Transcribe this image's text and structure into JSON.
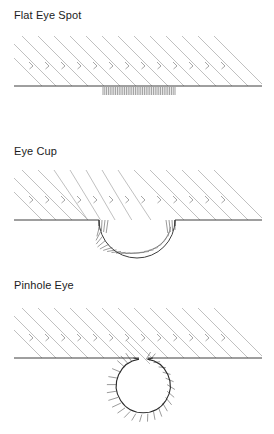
{
  "figure": {
    "background_color": "#ffffff",
    "text_color": "#1c1c1c",
    "ray_color": "#9a9a9a",
    "ground_color": "#444444",
    "hatch_color": "#6b6b6b",
    "outline_color": "#222222"
  },
  "panels": [
    {
      "id": "flat-eye-spot",
      "label": "Flat Eye Spot",
      "description": "Flat light-sensitive patch of photoreceptors on a straight surface; incoming parallel light rays strike the patch from all directions with no directional resolution.",
      "surface": "flat",
      "receptor_shape": "straight-patch",
      "receptor_span_px": [
        103,
        175
      ],
      "ground_line_y": 86,
      "ray_count": 14,
      "ray_angle_deg": 45,
      "ray_direction": "down-right",
      "arrowheads": true
    },
    {
      "id": "eye-cup",
      "label": "Eye Cup",
      "description": "Photoreceptor sheet invaginated into a cup-shaped depression; the curved wall shades receptors so the direction of incoming light can be detected.",
      "surface": "concave-cup",
      "receptor_shape": "semicircular-bowl",
      "cup_center_x": 137,
      "cup_rim_y": 86,
      "cup_radius_px": 37,
      "cup_left_rim_x": 99,
      "cup_right_rim_x": 175,
      "ground_line_y": 86,
      "ray_count": 14,
      "ray_angle_deg": 45,
      "ray_direction": "down-right",
      "arrowheads": true
    },
    {
      "id": "pinhole-eye",
      "label": "Pinhole Eye",
      "description": "Cup nearly closed into a chamber with a small aperture; the narrow opening acts as a pinhole that projects a focused inverted image onto the receptor layer.",
      "surface": "enclosed-chamber",
      "receptor_shape": "near-closed-circle",
      "chamber_center_x": 143,
      "chamber_center_y": 118,
      "chamber_radius_px": 27,
      "aperture_width_px": 9,
      "aperture_position": "top",
      "ground_line_y": 90,
      "ray_count": 14,
      "ray_angle_deg": 45,
      "ray_direction": "down-right",
      "arrowheads": true
    }
  ],
  "legend": {
    "rays_meaning": "incoming parallel light rays",
    "hatching_meaning": "photoreceptor cell layer"
  }
}
